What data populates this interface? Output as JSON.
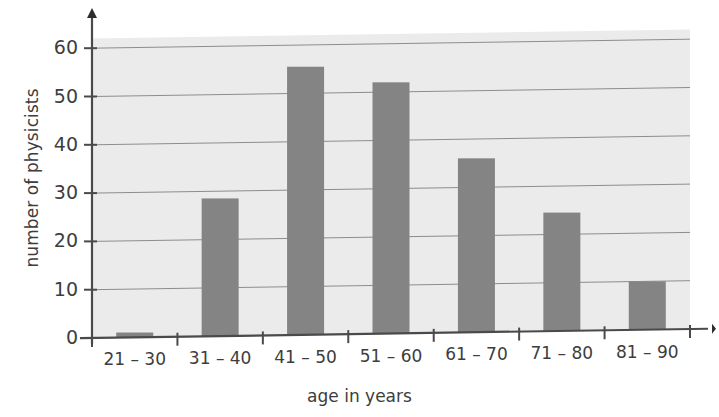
{
  "chart_data": {
    "type": "bar",
    "title": "",
    "subtitle": "",
    "xlabel": "age in years",
    "ylabel": "number of physicists",
    "categories": [
      "21 – 30",
      "31 – 40",
      "41 – 50",
      "51 – 60",
      "61 – 70",
      "71 – 80",
      "81 – 90"
    ],
    "values": [
      1,
      28.5,
      55.5,
      52,
      36,
      24.5,
      10
    ],
    "ylim": [
      0,
      62
    ],
    "yticks": [
      0,
      10,
      20,
      30,
      40,
      50,
      60
    ],
    "ytick_labels": [
      "0",
      "10",
      "20",
      "30",
      "40",
      "50",
      "60"
    ],
    "grid": true,
    "grid_axis": "y",
    "legend": false,
    "legend_position": "none",
    "bar_color": "#848484",
    "plot_background": "#ebebeb",
    "axis_color": "#4a4a4a",
    "gridline_color": "#8d8d8d",
    "text_color": "#3d3d3d",
    "series": [
      {
        "name": "number of physicists",
        "values": [
          1,
          28.5,
          55.5,
          52,
          36,
          24.5,
          10
        ]
      }
    ],
    "annotations": []
  }
}
